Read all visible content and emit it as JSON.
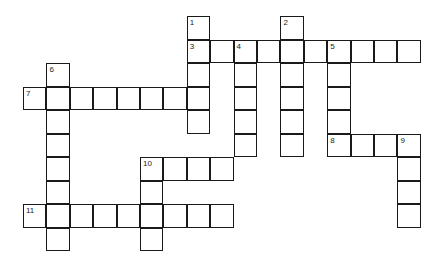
{
  "puzzle": {
    "type": "crossword",
    "cell_color": "#ffffff",
    "line_color": "#1a1a1a",
    "origin": {
      "x": 23,
      "y": 16
    },
    "cell_size": {
      "w": 23.4,
      "h": 23.5
    },
    "words": [
      {
        "number": 1,
        "direction": "down",
        "row": 0,
        "col": 7,
        "length": 5
      },
      {
        "number": 2,
        "direction": "down",
        "row": 0,
        "col": 11,
        "length": 6
      },
      {
        "number": 3,
        "direction": "across",
        "row": 1,
        "col": 7,
        "length": 10
      },
      {
        "number": 4,
        "direction": "down",
        "row": 1,
        "col": 9,
        "length": 5
      },
      {
        "number": 5,
        "direction": "down",
        "row": 1,
        "col": 13,
        "length": 5
      },
      {
        "number": 6,
        "direction": "down",
        "row": 2,
        "col": 1,
        "length": 8
      },
      {
        "number": 7,
        "direction": "across",
        "row": 3,
        "col": 0,
        "length": 8
      },
      {
        "number": 8,
        "direction": "across",
        "row": 5,
        "col": 13,
        "length": 4
      },
      {
        "number": 9,
        "direction": "down",
        "row": 5,
        "col": 16,
        "length": 4
      },
      {
        "number": 10,
        "direction": "across",
        "row": 6,
        "col": 5,
        "length": 4
      },
      {
        "number": 10,
        "direction": "down",
        "row": 6,
        "col": 5,
        "length": 4
      },
      {
        "number": 11,
        "direction": "across",
        "row": 8,
        "col": 0,
        "length": 9
      }
    ]
  }
}
